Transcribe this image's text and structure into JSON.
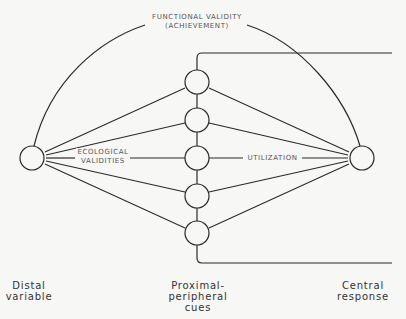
{
  "labels": {
    "functional_validity": "FUNCTIONAL VALIDITY",
    "achievement": "(ACHIEVEMENT)",
    "ecological_1": "ECOLOGICAL",
    "ecological_2": "VALIDITIES",
    "utilization": "UTILIZATION"
  },
  "captions": {
    "distal_1": "Distal",
    "distal_2": "variable",
    "proximal_1": "Proximal-",
    "proximal_2": "peripheral",
    "proximal_3": "cues",
    "central_1": "Central",
    "central_2": "response"
  },
  "nodes": {
    "distal": {
      "cx": 32,
      "cy": 158,
      "r": 12
    },
    "central": {
      "cx": 362,
      "cy": 158,
      "r": 12
    },
    "cues": [
      {
        "cx": 197,
        "cy": 82,
        "r": 12
      },
      {
        "cx": 197,
        "cy": 120,
        "r": 12
      },
      {
        "cx": 197,
        "cy": 158,
        "r": 12
      },
      {
        "cx": 197,
        "cy": 196,
        "r": 12
      },
      {
        "cx": 197,
        "cy": 233,
        "r": 12
      }
    ]
  },
  "colors": {
    "stroke": "#2a2a2a",
    "background": "#f7f7f5"
  }
}
